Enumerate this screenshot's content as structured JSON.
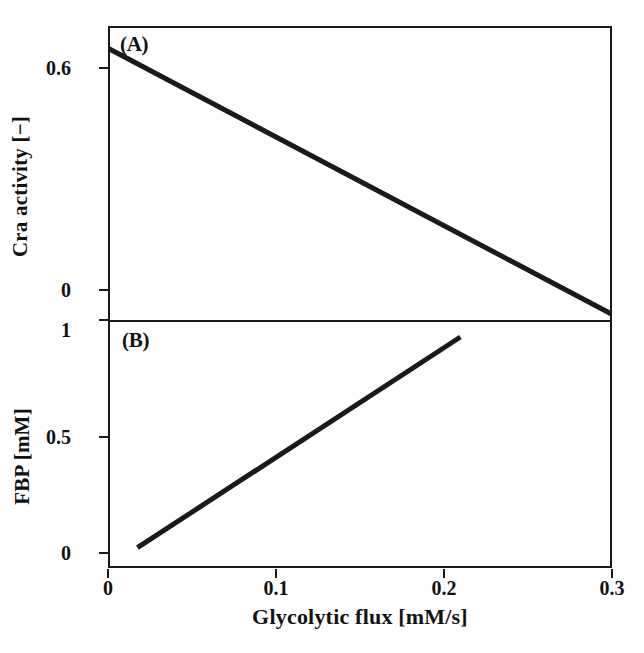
{
  "figure": {
    "background_color": "#ffffff",
    "line_color": "#1a1a1a",
    "axis_color": "#1a1a1a"
  },
  "xaxis": {
    "label": "Glycolytic flux [mM/s]",
    "ticks": [
      "0",
      "0.1",
      "0.2",
      "0.3"
    ],
    "tick_values": [
      0,
      0.1,
      0.2,
      0.3
    ],
    "range": [
      0,
      0.3
    ]
  },
  "panels": {
    "a": {
      "letter": "(A)",
      "ylabel": "Cra activity [−]",
      "yticks": [
        "0.6",
        "0"
      ],
      "ytick_values": [
        0.6,
        0
      ]
    },
    "b": {
      "letter": "(B)",
      "ylabel": "FBP [mM]",
      "yticks": [
        "1",
        "0.5",
        "0"
      ],
      "ytick_values": [
        1,
        0.5,
        0
      ]
    }
  },
  "chart_data": [
    {
      "type": "line",
      "title": "(A)",
      "xlabel": "Glycolytic flux [mM/s]",
      "ylabel": "Cra activity [−]",
      "xlim": [
        0,
        0.3
      ],
      "ylim": [
        0,
        0.65
      ],
      "xticks": [
        0,
        0.1,
        0.2,
        0.3
      ],
      "xticklabels": [
        "0",
        "0.1",
        "0.2",
        "0.3"
      ],
      "yticks": [
        0,
        0.6
      ],
      "yticklabels": [
        "0",
        "0.6"
      ],
      "grid": false,
      "legend": "none",
      "series": [
        {
          "name": "Cra activity",
          "color": "#1a1a1a",
          "linewidth": 5,
          "x": [
            0.0,
            0.05,
            0.1,
            0.15,
            0.2,
            0.25,
            0.3
          ],
          "y": [
            0.6,
            0.503,
            0.406,
            0.309,
            0.212,
            0.115,
            0.018
          ]
        }
      ]
    },
    {
      "type": "line",
      "title": "(B)",
      "xlabel": "Glycolytic flux [mM/s]",
      "ylabel": "FBP [mM]",
      "xlim": [
        0,
        0.3
      ],
      "ylim": [
        0,
        1.07
      ],
      "xticks": [
        0,
        0.1,
        0.2,
        0.3
      ],
      "xticklabels": [
        "0",
        "0.1",
        "0.2",
        "0.3"
      ],
      "yticks": [
        0,
        0.5,
        1
      ],
      "yticklabels": [
        "0",
        "0.5",
        "1"
      ],
      "grid": false,
      "legend": "none",
      "series": [
        {
          "name": "FBP",
          "color": "#1a1a1a",
          "linewidth": 5,
          "x": [
            0.017,
            0.06,
            0.1,
            0.14,
            0.18,
            0.21
          ],
          "y": [
            0.08,
            0.285,
            0.475,
            0.665,
            0.855,
            1.0
          ]
        }
      ]
    }
  ]
}
